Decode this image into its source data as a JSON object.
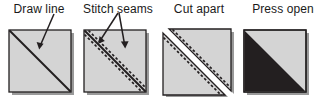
{
  "figure": {
    "title_sequence": "Half-square triangle piecing steps",
    "width": 326,
    "height": 102,
    "background": "#ffffff",
    "colors": {
      "fabric_light": "#d4d4d4",
      "fabric_dark": "#231f20",
      "outline": "#231f20",
      "shadow": "#9a9a9a",
      "text": "#1a1a1a",
      "cut_gap": "#ffffff"
    }
  },
  "panels": [
    {
      "id": "draw-line",
      "label": "Draw line",
      "x": 0,
      "width": 78,
      "square": {
        "x": 9,
        "y": 30,
        "size": 62
      },
      "fabric": "light",
      "diagonal": {
        "style": "solid",
        "from": "top-left",
        "to": "bottom-right"
      },
      "dashed_seams": 0,
      "arrows": 1,
      "arrow_targets": [
        "drawn diagonal line"
      ],
      "cut": false
    },
    {
      "id": "stitch-seams",
      "label": "Stitch seams",
      "x": 78,
      "width": 80,
      "square": {
        "x": 83,
        "y": 30,
        "size": 62
      },
      "fabric": "light",
      "diagonal": {
        "style": "solid",
        "from": "top-left",
        "to": "bottom-right"
      },
      "dashed_seams": 2,
      "seam_offset_px": 5,
      "arrows": 2,
      "arrow_targets": [
        "upper stitch line",
        "lower stitch line"
      ],
      "cut": false
    },
    {
      "id": "cut-apart",
      "label": "Cut apart",
      "x": 158,
      "width": 82,
      "square": {
        "x": 163,
        "y": 30,
        "size": 62
      },
      "fabric": "light",
      "diagonal": {
        "style": "cut",
        "from": "top-left",
        "to": "bottom-right"
      },
      "dashed_seams": 2,
      "seam_offset_px": 5,
      "arrows": 0,
      "arrow_targets": [],
      "cut": true,
      "cut_shift_px": 6
    },
    {
      "id": "press-open",
      "label": "Press open",
      "x": 240,
      "width": 86,
      "square": {
        "x": 244,
        "y": 30,
        "size": 62
      },
      "fabric": "two-tone",
      "diagonal": {
        "style": "seam",
        "from": "top-left",
        "to": "bottom-right"
      },
      "dashed_seams": 0,
      "arrows": 0,
      "arrow_targets": [],
      "cut": false,
      "dark_half": "lower-left",
      "light_half": "upper-right"
    }
  ]
}
